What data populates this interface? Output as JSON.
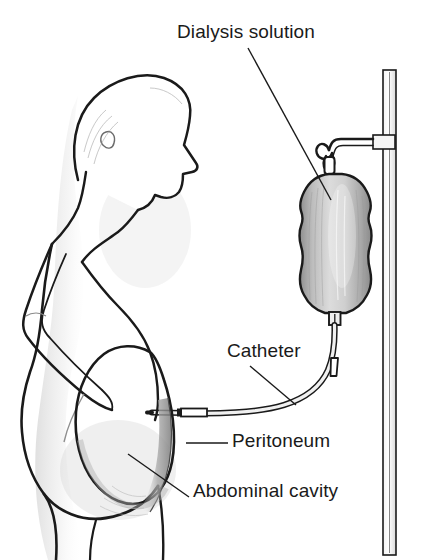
{
  "figure": {
    "background_color": "#ffffff",
    "ink_color": "#1a1a1a",
    "shade_color": "#b3b3b3",
    "width": 427,
    "height": 560
  },
  "labels": {
    "dialysis_solution": "Dialysis solution",
    "catheter": "Catheter",
    "peritoneum": "Peritoneum",
    "abdominal_cavity": "Abdominal cavity"
  },
  "parts": {
    "patient": "patient-profile-figure",
    "bag": "dialysis-solution-bag",
    "pole": "iv-pole",
    "hook": "bag-hanger-hook",
    "tube": "catheter-tube",
    "clamp": "catheter-clamp",
    "cavity": "abdominal-cavity-outline",
    "peritoneum_membrane": "peritoneum-membrane"
  }
}
